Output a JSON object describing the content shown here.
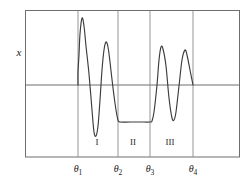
{
  "figure": {
    "title": "",
    "y_axis_label": "x",
    "background_color": "#ffffff",
    "frame_color": "#6e6e6e",
    "curve_color": "#3c3c3c",
    "gridline_color": "#8a8a8a"
  },
  "chart_data": {
    "type": "line",
    "title": "",
    "xlabel": "",
    "ylabel": "x",
    "grid": true,
    "legend": null,
    "axis_ticks": [
      {
        "id": "theta1",
        "base": "θ",
        "sub": "1",
        "x_px": 78
      },
      {
        "id": "theta2",
        "base": "θ",
        "sub": "2",
        "x_px": 118
      },
      {
        "id": "theta3",
        "base": "θ",
        "sub": "3",
        "x_px": 150
      },
      {
        "id": "theta4",
        "base": "θ",
        "sub": "4",
        "x_px": 193
      }
    ],
    "region_labels": [
      {
        "text": "I",
        "x_px": 97,
        "y_px": 145
      },
      {
        "text": "II",
        "x_px": 133,
        "y_px": 145
      },
      {
        "text": "III",
        "x_px": 170,
        "y_px": 145
      }
    ],
    "zero_line_y_px": 85,
    "frame": {
      "left": 25,
      "right": 240,
      "top": 10,
      "bottom": 157
    },
    "series": [
      {
        "name": "signal",
        "comment": "oscillatory trace: region I two damped peaks, region II flat plateau, region III two peaks",
        "points_px": [
          [
            78,
            85
          ],
          [
            78,
            72
          ],
          [
            79,
            55
          ],
          [
            80,
            34
          ],
          [
            82,
            18
          ],
          [
            84,
            26
          ],
          [
            86,
            46
          ],
          [
            89,
            74
          ],
          [
            92,
            110
          ],
          [
            94,
            132
          ],
          [
            96,
            136
          ],
          [
            98,
            126
          ],
          [
            100,
            100
          ],
          [
            102,
            70
          ],
          [
            104,
            50
          ],
          [
            106,
            42
          ],
          [
            108,
            47
          ],
          [
            110,
            62
          ],
          [
            113,
            88
          ],
          [
            116,
            110
          ],
          [
            118,
            120
          ],
          [
            120,
            122
          ],
          [
            130,
            122
          ],
          [
            140,
            122
          ],
          [
            150,
            122
          ],
          [
            152,
            121
          ],
          [
            154,
            112
          ],
          [
            157,
            85
          ],
          [
            159,
            60
          ],
          [
            161,
            47
          ],
          [
            163,
            49
          ],
          [
            166,
            66
          ],
          [
            169,
            98
          ],
          [
            172,
            118
          ],
          [
            174,
            120
          ],
          [
            176,
            112
          ],
          [
            179,
            86
          ],
          [
            182,
            60
          ],
          [
            185,
            50
          ],
          [
            187,
            55
          ],
          [
            190,
            70
          ],
          [
            193,
            85
          ]
        ]
      }
    ]
  }
}
